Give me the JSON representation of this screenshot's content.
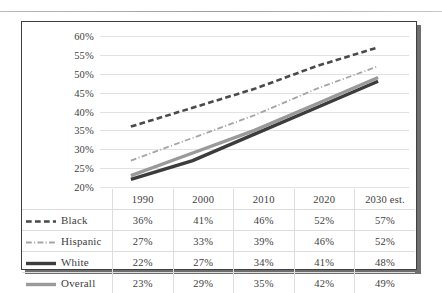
{
  "chart_data": {
    "type": "line",
    "title": "",
    "xlabel": "",
    "ylabel": "",
    "categories": [
      "1990",
      "2000",
      "2010",
      "2020",
      "2030 est."
    ],
    "ylim": [
      20,
      60
    ],
    "ytick_step": 5,
    "ytick_labels": [
      "60%",
      "55%",
      "50%",
      "45%",
      "40%",
      "35%",
      "30%",
      "25%",
      "20%"
    ],
    "grid": true,
    "legend_position": "table-left-column",
    "series": [
      {
        "name": "Black",
        "values": [
          36,
          41,
          46,
          52,
          57
        ],
        "labels": [
          "36%",
          "41%",
          "46%",
          "52%",
          "57%"
        ],
        "style": "dashed",
        "color": "#4a4a4a",
        "width": 2.6
      },
      {
        "name": "Hispanic",
        "values": [
          27,
          33,
          39,
          46,
          52
        ],
        "labels": [
          "27%",
          "33%",
          "39%",
          "46%",
          "52%"
        ],
        "style": "dashdot",
        "color": "#a5a5a5",
        "width": 1.8
      },
      {
        "name": "White",
        "values": [
          22,
          27,
          34,
          41,
          48
        ],
        "labels": [
          "22%",
          "27%",
          "34%",
          "41%",
          "48%"
        ],
        "style": "solid",
        "color": "#3c3c3c",
        "width": 3.4
      },
      {
        "name": "Overall",
        "values": [
          23,
          29,
          35,
          42,
          49
        ],
        "labels": [
          "23%",
          "29%",
          "35%",
          "42%",
          "49%"
        ],
        "style": "solid",
        "color": "#9a9a9a",
        "width": 3.4
      }
    ]
  },
  "table": {
    "corner_label": "",
    "header": [
      "1990",
      "2000",
      "2010",
      "2020",
      "2030 est."
    ],
    "rows": [
      {
        "label": "Black",
        "cells": [
          "36%",
          "41%",
          "46%",
          "52%",
          "57%"
        ]
      },
      {
        "label": "Hispanic",
        "cells": [
          "27%",
          "33%",
          "39%",
          "46%",
          "52%"
        ]
      },
      {
        "label": "White",
        "cells": [
          "22%",
          "27%",
          "34%",
          "41%",
          "48%"
        ]
      },
      {
        "label": "Overall",
        "cells": [
          "23%",
          "29%",
          "35%",
          "42%",
          "49%"
        ]
      }
    ]
  },
  "theme": {
    "frame_border": "#3f3f3f",
    "gridline": "#e2e2e2",
    "text": "#3e3e3e",
    "shadow": "#6e6e6e",
    "top_rule": "#9d9d9d"
  }
}
